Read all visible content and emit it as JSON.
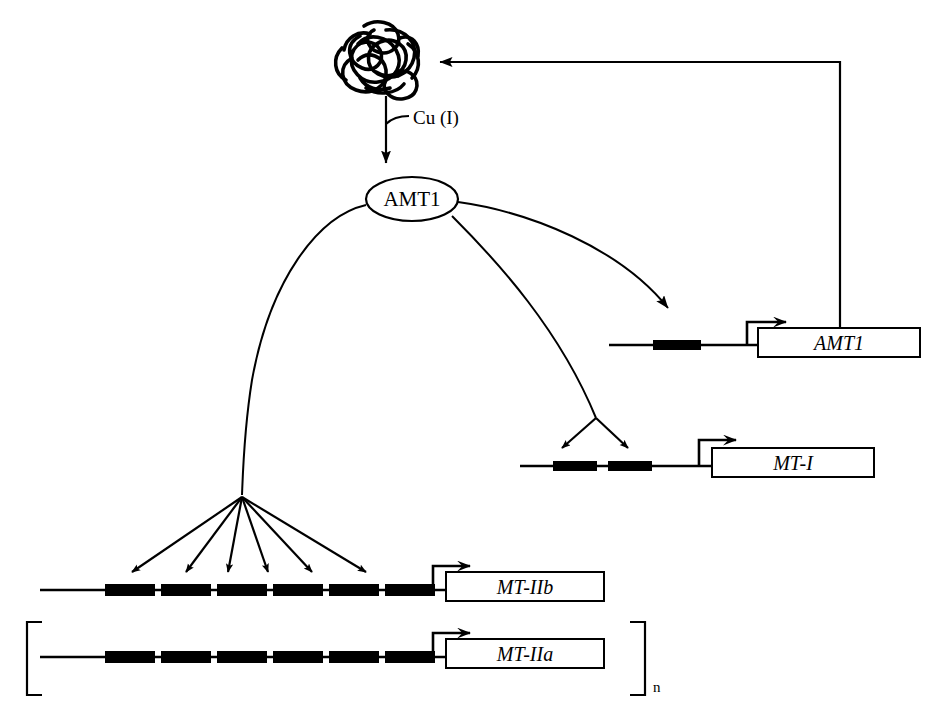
{
  "figure": {
    "type": "biological-pathway-diagram",
    "title": "",
    "background_color": "#ffffff",
    "line_color": "#000000",
    "element_fill": "#ffffff"
  },
  "nodes": {
    "apo_protein": {
      "label": "",
      "icon_name": "tangled-protein-blob",
      "description": "unfolded apo-protein scribble"
    },
    "transcription_factor": {
      "label": "AMT1",
      "shape": "ellipse"
    }
  },
  "ligand": {
    "label": "Cu (I)"
  },
  "arrows": {
    "activation_label": "",
    "feedback_label": ""
  },
  "genes": [
    {
      "id": "amt1",
      "label": "AMT1",
      "binding_sites": 1,
      "incoming_arrows": 1
    },
    {
      "id": "mt-i",
      "label": "MT-I",
      "binding_sites": 2,
      "incoming_arrows": 2
    },
    {
      "id": "mt-iib",
      "label": "MT-IIb",
      "binding_sites": 6,
      "incoming_arrows": 6
    },
    {
      "id": "mt-iia",
      "label": "MT-IIa",
      "binding_sites": 6,
      "incoming_arrows": 0
    }
  ],
  "repeat": {
    "subscript": "n",
    "bracket": "[ ]"
  }
}
